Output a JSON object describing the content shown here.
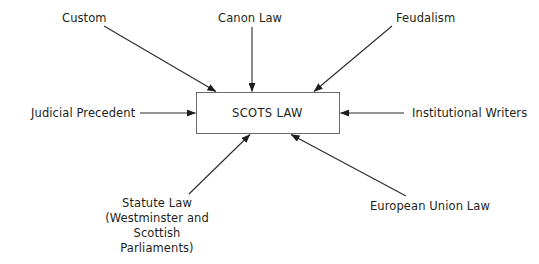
{
  "diagram": {
    "center_node": {
      "label": "SCOTS LAW",
      "shape": "rectangle"
    },
    "colors": {
      "text": "#231f20",
      "stroke": "#2b2b2b",
      "box_stroke": "#555555",
      "background": "#ffffff"
    },
    "sources": [
      {
        "id": "custom",
        "label": "Custom",
        "direction": "top-left"
      },
      {
        "id": "canon-law",
        "label": "Canon Law",
        "direction": "top"
      },
      {
        "id": "feudalism",
        "label": "Feudalism",
        "direction": "top-right"
      },
      {
        "id": "judicial-precedent",
        "label": "Judicial Precedent",
        "direction": "left"
      },
      {
        "id": "institutional-writers",
        "label": "Institutional Writers",
        "direction": "right"
      },
      {
        "id": "statute-law",
        "label": "Statute Law",
        "label_line2": "(Westminster and",
        "label_line3": "Scottish Parliaments)",
        "direction": "bottom-left"
      },
      {
        "id": "european-union-law",
        "label": "European Union Law",
        "direction": "bottom-right"
      }
    ]
  }
}
